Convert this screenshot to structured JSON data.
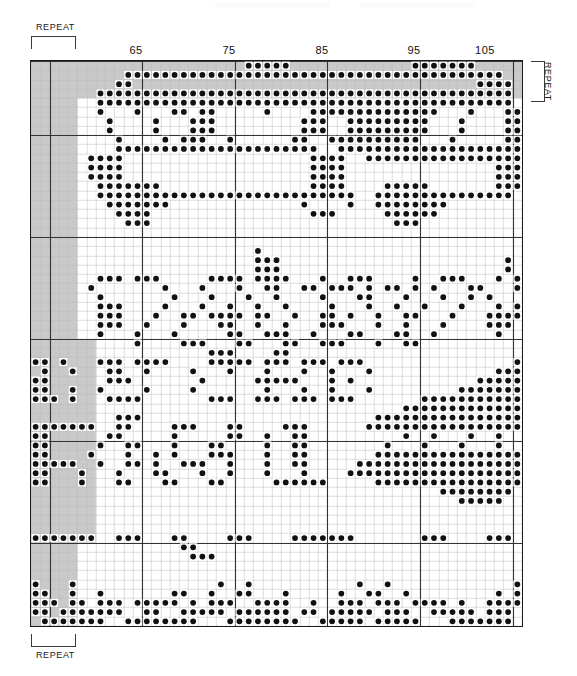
{
  "doc": {
    "kind": "filet-crochet-chart",
    "repeat_label": "REPEAT"
  },
  "labels": {
    "repeat_top_left": "REPEAT",
    "repeat_bottom_left": "REPEAT",
    "repeat_right": "REPEAT"
  },
  "chart_data": {
    "type": "heatmap",
    "title": "",
    "subtitle": "",
    "xlabel": "",
    "ylabel": "",
    "grid": true,
    "legend": "none",
    "cell_px": 9.25,
    "cols": 53,
    "rows": 61,
    "first_col_number": 57,
    "last_col_number": 109,
    "column_tick_labels": [
      "65",
      "75",
      "85",
      "95",
      "105"
    ],
    "column_tick_values": [
      65,
      75,
      85,
      95,
      105
    ],
    "column_tick_cols": [
      8,
      18,
      28,
      38,
      48
    ],
    "heavy_vline_cols": [
      2,
      12,
      22,
      32,
      42,
      52
    ],
    "heavy_hline_rows": [
      0,
      8,
      19,
      30,
      41,
      52,
      61
    ],
    "colors": {
      "dot": "#111111",
      "filled_cell_bg": "#ffffff",
      "shade": "#c9c9c9",
      "grid_light": "#b8b8b8",
      "grid_heavy": "#333333",
      "border": "#1a1a1a",
      "page_bg": "#ffffff"
    },
    "shaded_regions": [
      {
        "name": "left-repeat-band",
        "col_start": 0,
        "col_end": 5,
        "row_start": 0,
        "row_end": 61
      },
      {
        "name": "top-repeat-band",
        "col_start": 0,
        "col_end": 53,
        "row_start": 0,
        "row_end": 4
      },
      {
        "name": "left-lower-extension",
        "col_start": 0,
        "col_end": 7,
        "row_start": 30,
        "row_end": 52
      }
    ],
    "repeat_bracket_top": {
      "col_start": 0,
      "col_end": 5
    },
    "repeat_bracket_bottom": {
      "col_start": 0,
      "col_end": 5
    },
    "repeat_bracket_right": {
      "row_start": 0,
      "row_end": 4
    },
    "filled_cells": [
      [
        0,
        "000000000000000000000001111100000000000001111111000000"
      ],
      [
        1,
        "000000000011111111111111111111111111111111111111111000"
      ],
      [
        2,
        "000000000110000000000000000000000000000000000000111100"
      ],
      [
        3,
        "000000011111111111111111111111111111111111111111111100"
      ],
      [
        4,
        "000000011111111111111111111111111111111111111111111100"
      ],
      [
        5,
        "000000010001000110110000010000111111111111110001000110"
      ],
      [
        6,
        "000000001000010001110000000001110011111111100010000110"
      ],
      [
        7,
        "000000001000010001110000000001110011111111100010000110"
      ],
      [
        8,
        "000000000100001011100100000011001111111111000100000110"
      ],
      [
        9,
        "000000000111111111111111111111100111111111111111111110"
      ],
      [
        10,
        "000000111100000000000000000000111100111111111111111111"
      ],
      [
        11,
        "000000111100000000000000000000111100000000000000001110"
      ],
      [
        12,
        "000000111100000000000000000000111100000000000000001110"
      ],
      [
        13,
        "000000011111110000000000000000111100001111100000001110"
      ],
      [
        14,
        "000000011111111111111111111111111110011111111111111100"
      ],
      [
        15,
        "000000001111111000000000000001000010011111111000000000"
      ],
      [
        16,
        "000000000111100000000000000000111000001111110000000000"
      ],
      [
        17,
        "000000000011100000000000000000000000000111000000000000"
      ],
      [
        18,
        "000000000000000000000000000000000000000000000000000000"
      ],
      [
        19,
        "000000000000000000000000000000000000000000000000000000"
      ],
      [
        20,
        "000000000000000000000000100000000000000000000000000000"
      ],
      [
        21,
        "000000000000000000000000111000000000000000000000000100"
      ],
      [
        22,
        "000000000000000000000000111000000000000000000000000100"
      ],
      [
        23,
        "000000011101110000011110111100010011100001001110001011"
      ],
      [
        24,
        "000000100000001000100010011001101110101101010001100011"
      ],
      [
        25,
        "000000010000000100010001001000010001100010001001010001"
      ],
      [
        26,
        "000000011100001000100100100100001000100100100010001011"
      ],
      [
        27,
        "000000011100010011011110110010011010010011000100011110"
      ],
      [
        28,
        "000000011100100010001100100100011100010010001000011100"
      ],
      [
        29,
        "000000010001000100000110011100100011000110010000001000"
      ],
      [
        30,
        "000000000001000011100011000110011100010011000000000000"
      ],
      [
        31,
        "000000000000000000011100001100000000000000000000000000"
      ],
      [
        32,
        "110100011101111000011111011101110111000000000000000011"
      ],
      [
        33,
        "010010001100100001000100010001001000100000000000001111"
      ],
      [
        34,
        "110000001110000000100000111110001010000000000000111111"
      ],
      [
        35,
        "110010010000100001000000010001001000100000000011111111"
      ],
      [
        36,
        "111010001111000000011100111011101110000000111111111111"
      ],
      [
        37,
        "000000000000000000000000000000000000000011111111111111"
      ],
      [
        38,
        "000000000111000000000000000000000000011111111111111111"
      ],
      [
        39,
        "111111100110000111000110000111000000111111111111111111"
      ],
      [
        40,
        "110000001100000100000110010011000000000010010001001001"
      ],
      [
        41,
        "110000010011000100011000010011000000001000100010001001"
      ],
      [
        42,
        "110000100010010100011100010011000000011111111111111111"
      ],
      [
        43,
        "111110010011010011100100010011000001111111111111111111"
      ],
      [
        44,
        "110001000100011000100100010001000011111111111111111111"
      ],
      [
        45,
        "110001000110001100011000001111110000011111111111111110"
      ],
      [
        46,
        "000000000000000000000000000000000000000000001111111100"
      ],
      [
        47,
        "000000000000000000000000000000000000000000000011111000"
      ],
      [
        48,
        "000000000000000000000000000000000000000000000000000000"
      ],
      [
        49,
        "000000000000000000000000000000000000000000000000000000"
      ],
      [
        50,
        "000000000000000000000000000000000000000000000000000000"
      ],
      [
        51,
        "111111100111000110000111000011111110000000111000011100"
      ],
      [
        52,
        "000000000000000011000000000000000000000000000000000000"
      ],
      [
        53,
        "000000000000000001110000000000000000000000000000000000"
      ],
      [
        54,
        "000000000000000000000000000000000000000000000000000000"
      ],
      [
        55,
        "000000000000000000000000000000000000000000000000000000"
      ],
      [
        56,
        "100010000000000000001001000000000001001000000000000010"
      ],
      [
        57,
        "110010010000000110010011000100000100110010000000001011"
      ],
      [
        58,
        "111011011101111101011100111100100111011101111010011111"
      ],
      [
        59,
        "110111111100110011111011111101101111101110011111011101"
      ],
      [
        60,
        "011111110011111111000111111110011111011111000111111100"
      ]
    ]
  }
}
